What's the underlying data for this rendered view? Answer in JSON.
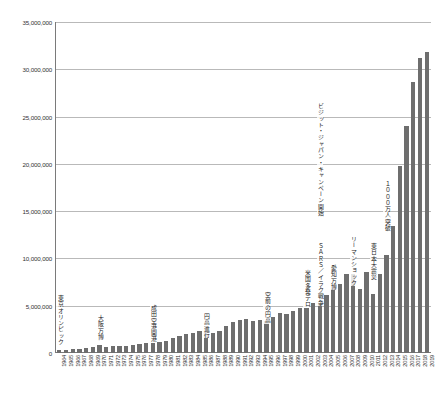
{
  "chart_data": {
    "type": "bar",
    "title": "",
    "subtitle": "",
    "xlabel": "",
    "ylabel": "",
    "ylim": [
      0,
      35000000
    ],
    "grid": true,
    "legend": false,
    "legend_position": "none",
    "bar_color": "#6e6e6e",
    "ytick_labels": [
      "35,000,000",
      "30,000,000",
      "25,000,000",
      "20,000,000",
      "15,000,000",
      "10,000,000",
      "5,000,000",
      "0"
    ],
    "ytick_values": [
      35000000,
      30000000,
      25000000,
      20000000,
      15000000,
      10000000,
      5000000,
      0
    ],
    "categories": [
      "1964",
      "1965",
      "1966",
      "1967",
      "1968",
      "1969",
      "1970",
      "1971",
      "1972",
      "1973",
      "1974",
      "1975",
      "1976",
      "1977",
      "1978",
      "1979",
      "1980",
      "1981",
      "1982",
      "1983",
      "1984",
      "1985",
      "1986",
      "1987",
      "1988",
      "1989",
      "1990",
      "1991",
      "1992",
      "1993",
      "1994",
      "1995",
      "1996",
      "1997",
      "1998",
      "1999",
      "2000",
      "2001",
      "2002",
      "2003",
      "2004",
      "2005",
      "2006",
      "2007",
      "2008",
      "2009",
      "2010",
      "2011",
      "2012",
      "2013",
      "2014",
      "2015",
      "2016",
      "2017",
      "2018",
      "2019"
    ],
    "values": [
      352000,
      366000,
      433000,
      477000,
      519000,
      608000,
      854000,
      661000,
      724000,
      785000,
      764000,
      812000,
      915000,
      1030000,
      1039000,
      1113000,
      1317000,
      1583000,
      1793000,
      1968000,
      2110000,
      2327000,
      2061000,
      2155000,
      2355000,
      2835000,
      3236000,
      3533000,
      3582000,
      3410000,
      3468000,
      3345000,
      3837000,
      4218000,
      4106000,
      4438000,
      4757000,
      4772000,
      5239000,
      5212000,
      6138000,
      6728000,
      7334000,
      8347000,
      8351000,
      6790000,
      8611000,
      6219000,
      8358000,
      10364000,
      13413000,
      19737000,
      24039000,
      28691000,
      31192000,
      31882000
    ],
    "annotations": [
      {
        "text": "東京オリンピック",
        "category": "1964"
      },
      {
        "text": "大阪万博",
        "category": "1970"
      },
      {
        "text": "成田空港開港",
        "category": "1978"
      },
      {
        "text": "円高進行",
        "category": "1986"
      },
      {
        "text": "空前の円高",
        "category": "1995"
      },
      {
        "text": "米国多発テロ",
        "category": "2001"
      },
      {
        "text": "ＳＡＲＳ／イラク戦争",
        "category": "2003"
      },
      {
        "text": "ビジット・ジャパン・キャンペーン開始",
        "category": "2003"
      },
      {
        "text": "愛知万博",
        "category": "2005"
      },
      {
        "text": "リーマンショック",
        "category": "2008"
      },
      {
        "text": "東日本大震災",
        "category": "2011"
      },
      {
        "text": "１０００万人突破",
        "category": "2013"
      }
    ]
  }
}
